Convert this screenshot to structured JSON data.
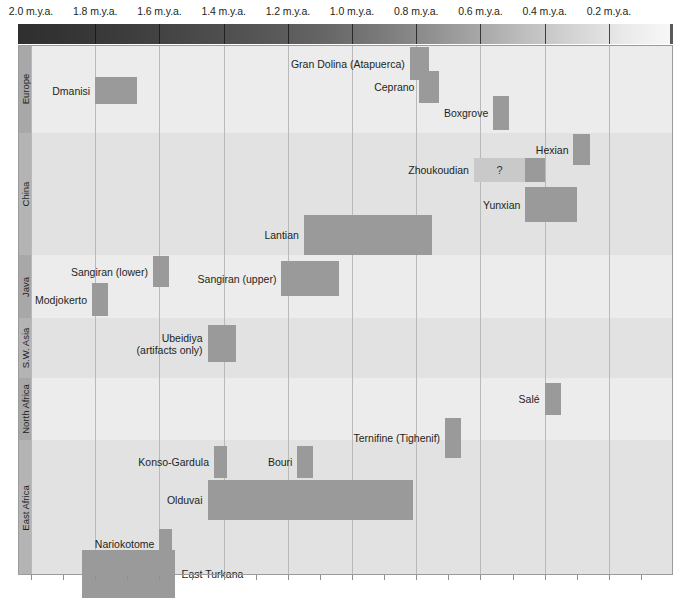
{
  "chart_data": {
    "type": "bar",
    "subtype": "horizontal-range-timeline",
    "title": "",
    "xlabel": "",
    "ylabel": "",
    "xlim": [
      2.0,
      0.0
    ],
    "x_unit": "m.y.a.",
    "grid": true,
    "legend": "none",
    "axis_ticks": [
      {
        "value": 2.0,
        "label": "2.0 m.y.a."
      },
      {
        "value": 1.8,
        "label": "1.8 m.y.a."
      },
      {
        "value": 1.6,
        "label": "1.6 m.y.a."
      },
      {
        "value": 1.4,
        "label": "1.4 m.y.a."
      },
      {
        "value": 1.2,
        "label": "1.2 m.y.a."
      },
      {
        "value": 1.0,
        "label": "1.0 m.y.a."
      },
      {
        "value": 0.8,
        "label": "0.8 m.y.a."
      },
      {
        "value": 0.6,
        "label": "0.6 m.y.a."
      },
      {
        "value": 0.4,
        "label": "0.4 m.y.a."
      },
      {
        "value": 0.2,
        "label": "0.2 m.y.a."
      }
    ],
    "regions": [
      {
        "name": "Europe",
        "sites": [
          {
            "label": "Dmanisi",
            "start": 1.8,
            "end": 1.67,
            "label_side": "left",
            "uncertain": false
          },
          {
            "label": "Gran Dolina (Atapuerca)",
            "start": 0.82,
            "end": 0.76,
            "label_side": "left",
            "uncertain": false
          },
          {
            "label": "Ceprano",
            "start": 0.79,
            "end": 0.73,
            "label_side": "left",
            "uncertain": false
          },
          {
            "label": "Boxgrove",
            "start": 0.56,
            "end": 0.51,
            "label_side": "left",
            "uncertain": false
          }
        ]
      },
      {
        "name": "China",
        "sites": [
          {
            "label": "Hexian",
            "start": 0.31,
            "end": 0.26,
            "label_side": "left",
            "uncertain": false
          },
          {
            "label": "Zhoukoudian",
            "start": 0.62,
            "end": 0.4,
            "label_side": "left",
            "uncertain": true,
            "uncertain_to": 0.46,
            "uncertain_marker": "?"
          },
          {
            "label": "Yunxian",
            "start": 0.46,
            "end": 0.3,
            "label_side": "left",
            "uncertain": false
          },
          {
            "label": "Lantian",
            "start": 1.15,
            "end": 0.75,
            "label_side": "left",
            "uncertain": false
          }
        ]
      },
      {
        "name": "Java",
        "sites": [
          {
            "label": "Sangiran (lower)",
            "start": 1.62,
            "end": 1.57,
            "label_side": "left",
            "uncertain": false
          },
          {
            "label": "Sangiran (upper)",
            "start": 1.22,
            "end": 1.04,
            "label_side": "left",
            "uncertain": false
          },
          {
            "label": "Modjokerto",
            "start": 1.81,
            "end": 1.76,
            "label_side": "left",
            "uncertain": false
          }
        ]
      },
      {
        "name": "S.W. Asia",
        "sites": [
          {
            "label": "Ubeidiya\n(artifacts only)",
            "line1": "Ubeidiya",
            "line2": "(artifacts only)",
            "start": 1.45,
            "end": 1.36,
            "label_side": "left",
            "uncertain": false
          }
        ]
      },
      {
        "name": "North Africa",
        "sites": [
          {
            "label": "Salé",
            "start": 0.4,
            "end": 0.35,
            "label_side": "left",
            "uncertain": false
          },
          {
            "label": "Ternifine (Tighenif)",
            "start": 0.71,
            "end": 0.66,
            "label_side": "left",
            "uncertain": false
          }
        ]
      },
      {
        "name": "East Africa",
        "sites": [
          {
            "label": "Konso-Gardula",
            "start": 1.43,
            "end": 1.39,
            "label_side": "left",
            "uncertain": false
          },
          {
            "label": "Bouri",
            "start": 1.17,
            "end": 1.12,
            "label_side": "left",
            "uncertain": false
          },
          {
            "label": "Olduvai",
            "start": 1.45,
            "end": 0.81,
            "label_side": "left",
            "uncertain": false
          },
          {
            "label": "Nariokotome",
            "start": 1.6,
            "end": 1.56,
            "label_side": "left",
            "uncertain": false
          },
          {
            "label": "East Turkana",
            "start": 1.84,
            "end": 1.55,
            "label_side": "right",
            "uncertain": false
          }
        ]
      }
    ],
    "colors": {
      "bar": "#9a9a9a",
      "bar_uncertain": "#c9c9c9",
      "band": "#ececec",
      "band_alt": "#e2e2e2",
      "region_column": "#a8a8a8",
      "gridline": "#b9b9b9",
      "text": "#231f20",
      "gradient_from": "#2f2f2f",
      "gradient_to": "#f7f7f7"
    }
  },
  "watermarks": [
    {
      "text": "",
      "x": 0,
      "y": 0,
      "size": 0
    }
  ]
}
